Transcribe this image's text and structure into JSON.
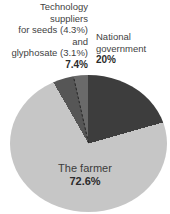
{
  "chart_data": {
    "type": "pie",
    "title": "",
    "unit": "%",
    "start_angle_deg": 0,
    "direction": "clockwise",
    "legend_position": "none",
    "slices": [
      {
        "label": "National government",
        "value": 20,
        "color": "#3d3d3d"
      },
      {
        "label": "The farmer",
        "value": 72.6,
        "color": "#c6c6c6"
      },
      {
        "label": "Technology suppliers for seeds",
        "value": 4.3,
        "color": "#565656"
      },
      {
        "label": "Technology suppliers for glyphosate",
        "value": 3.1,
        "color": "#6a6a6a",
        "dashed_boundary_before": true
      }
    ]
  },
  "labels": {
    "tech": {
      "lines": [
        "Technology",
        "suppliers",
        "for seeds (4.3%)",
        "and",
        "glyphosate (3.1%)"
      ],
      "pct": "7.4%"
    },
    "gov": {
      "lines": [
        "National",
        "government"
      ],
      "pct": "20%"
    },
    "farmer": {
      "name": "The farmer",
      "pct": "72.6%"
    }
  }
}
